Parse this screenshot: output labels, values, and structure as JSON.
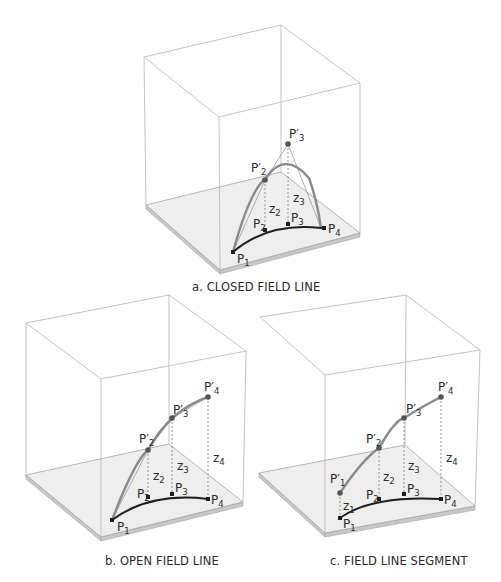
{
  "colors": {
    "cube_edge": "#b4b4b4",
    "plate_fill": "#eeeeee",
    "plate_side": "#c8c8c8",
    "plate_edge": "#9a9a9a",
    "ground_curve": "#1e1e1e",
    "lifted_curve": "#8a8a8a",
    "construction_line": "#9a9a9a",
    "dashed_line": "#7a7a7a",
    "point": "#555555",
    "ground_point": "#1e1e1e",
    "text": "#2a2a2a"
  },
  "panels": [
    {
      "id": "a",
      "caption": "a. CLOSED FIELD LINE",
      "caption_pos": [
        192,
        291
      ],
      "cube": {
        "top": [
          [
            144,
            57
          ],
          [
            281,
            25
          ],
          [
            360,
            83
          ],
          [
            219,
            117
          ]
        ],
        "bottom": [
          [
            146,
            205
          ],
          [
            281,
            172
          ],
          [
            360,
            233
          ],
          [
            220,
            270
          ]
        ],
        "hidden_left_vertical": false
      },
      "ground_curve": "M233,252 Q268,222 321,228",
      "lifted_curve": "M233,252 Q250,190 266,178 Q285,150 309,178 Q317,200 321,228",
      "construction": [
        [
          [
            233,
            252
          ],
          [
            265,
            180
          ]
        ],
        [
          [
            265,
            180
          ],
          [
            288,
            144
          ]
        ],
        [
          [
            288,
            144
          ],
          [
            321,
            228
          ]
        ]
      ],
      "dashed": [
        [
          [
            265,
            180
          ],
          [
            265,
            230
          ]
        ],
        [
          [
            288,
            144
          ],
          [
            288,
            224
          ]
        ]
      ],
      "lifted_points": [
        {
          "name": "P'2",
          "xy": [
            265,
            180
          ],
          "label_xy": [
            251,
            172
          ]
        },
        {
          "name": "P'3",
          "xy": [
            288,
            144
          ],
          "label_xy": [
            289,
            138
          ]
        }
      ],
      "ground_points": [
        {
          "name": "P1",
          "xy": [
            233,
            252
          ],
          "label_xy": [
            237,
            263
          ]
        },
        {
          "name": "P2",
          "xy": [
            265,
            230
          ],
          "label_xy": [
            253,
            228
          ]
        },
        {
          "name": "P3",
          "xy": [
            288,
            224
          ],
          "label_xy": [
            291,
            222
          ]
        },
        {
          "name": "P4",
          "xy": [
            324,
            228
          ],
          "label_xy": [
            328,
            233
          ]
        }
      ],
      "z_labels": [
        {
          "name": "z2",
          "xy": [
            269,
            213
          ]
        },
        {
          "name": "z3",
          "xy": [
            293,
            202
          ]
        }
      ]
    },
    {
      "id": "b",
      "caption": "b. OPEN FIELD LINE",
      "caption_pos": [
        105,
        565
      ],
      "cube": {
        "top": [
          [
            26,
            323
          ],
          [
            169,
            295
          ],
          [
            246,
            351
          ],
          [
            101,
            379
          ]
        ],
        "bottom": [
          [
            26,
            475
          ],
          [
            169,
            444
          ],
          [
            243,
            502
          ],
          [
            101,
            537
          ]
        ],
        "hidden_left_vertical": false
      },
      "ground_curve": "M112,520 Q150,492 208,499",
      "lifted_curve": "M112,520 Q135,460 148,450 Q170,410 208,397",
      "construction": [
        [
          [
            112,
            520
          ],
          [
            148,
            450
          ]
        ],
        [
          [
            148,
            450
          ],
          [
            172,
            418
          ]
        ],
        [
          [
            172,
            418
          ],
          [
            208,
            397
          ]
        ]
      ],
      "dashed": [
        [
          [
            148,
            450
          ],
          [
            148,
            497
          ]
        ],
        [
          [
            172,
            418
          ],
          [
            172,
            494
          ]
        ],
        [
          [
            208,
            397
          ],
          [
            208,
            499
          ]
        ]
      ],
      "lifted_points": [
        {
          "name": "P'2",
          "xy": [
            148,
            450
          ],
          "label_xy": [
            139,
            443
          ]
        },
        {
          "name": "P'3",
          "xy": [
            172,
            418
          ],
          "label_xy": [
            173,
            414
          ]
        },
        {
          "name": "P'4",
          "xy": [
            208,
            397
          ],
          "label_xy": [
            204,
            391
          ]
        }
      ],
      "ground_points": [
        {
          "name": "P1",
          "xy": [
            112,
            520
          ],
          "label_xy": [
            117,
            531
          ]
        },
        {
          "name": "P2",
          "xy": [
            148,
            497
          ],
          "label_xy": [
            137,
            498
          ]
        },
        {
          "name": "P3",
          "xy": [
            172,
            494
          ],
          "label_xy": [
            175,
            492
          ]
        },
        {
          "name": "P4",
          "xy": [
            208,
            499
          ],
          "label_xy": [
            211,
            504
          ]
        }
      ],
      "z_labels": [
        {
          "name": "z2",
          "xy": [
            153,
            480
          ]
        },
        {
          "name": "z3",
          "xy": [
            177,
            470
          ]
        },
        {
          "name": "z4",
          "xy": [
            213,
            462
          ]
        }
      ]
    },
    {
      "id": "c",
      "caption": "c. FIELD LINE SEGMENT",
      "caption_pos": [
        330,
        565
      ],
      "cube": {
        "top": [
          [
            260,
            317
          ],
          [
            406,
            295
          ],
          [
            480,
            350
          ],
          [
            325,
            375
          ]
        ],
        "bottom": [
          [
            259,
            473
          ],
          [
            405,
            445
          ],
          [
            475,
            506
          ],
          [
            325,
            533
          ]
        ],
        "hidden_left_vertical": true
      },
      "ground_curve": "M340,518 Q372,495 441,499",
      "lifted_curve": "M340,493 Q362,460 379,448 Q395,420 404,418 Q425,405 441,397",
      "construction": [],
      "dashed": [
        [
          [
            340,
            493
          ],
          [
            340,
            518
          ]
        ],
        [
          [
            379,
            448
          ],
          [
            379,
            499
          ]
        ],
        [
          [
            404,
            418
          ],
          [
            404,
            494
          ]
        ],
        [
          [
            441,
            397
          ],
          [
            441,
            499
          ]
        ]
      ],
      "lifted_points": [
        {
          "name": "P'1",
          "xy": [
            340,
            493
          ],
          "label_xy": [
            330,
            483
          ]
        },
        {
          "name": "P'2",
          "xy": [
            379,
            448
          ],
          "label_xy": [
            366,
            443
          ]
        },
        {
          "name": "P'3",
          "xy": [
            404,
            418
          ],
          "label_xy": [
            406,
            413
          ]
        },
        {
          "name": "P'4",
          "xy": [
            441,
            397
          ],
          "label_xy": [
            438,
            391
          ]
        }
      ],
      "ground_points": [
        {
          "name": "P1",
          "xy": [
            340,
            518
          ],
          "label_xy": [
            343,
            528
          ]
        },
        {
          "name": "P2",
          "xy": [
            379,
            499
          ],
          "label_xy": [
            366,
            499
          ]
        },
        {
          "name": "P3",
          "xy": [
            404,
            494
          ],
          "label_xy": [
            407,
            493
          ]
        },
        {
          "name": "P4",
          "xy": [
            441,
            499
          ],
          "label_xy": [
            444,
            504
          ]
        }
      ],
      "z_labels": [
        {
          "name": "z1",
          "xy": [
            343,
            510
          ]
        },
        {
          "name": "z2",
          "xy": [
            383,
            481
          ]
        },
        {
          "name": "z3",
          "xy": [
            408,
            470
          ]
        },
        {
          "name": "z4",
          "xy": [
            446,
            462
          ]
        }
      ]
    }
  ]
}
